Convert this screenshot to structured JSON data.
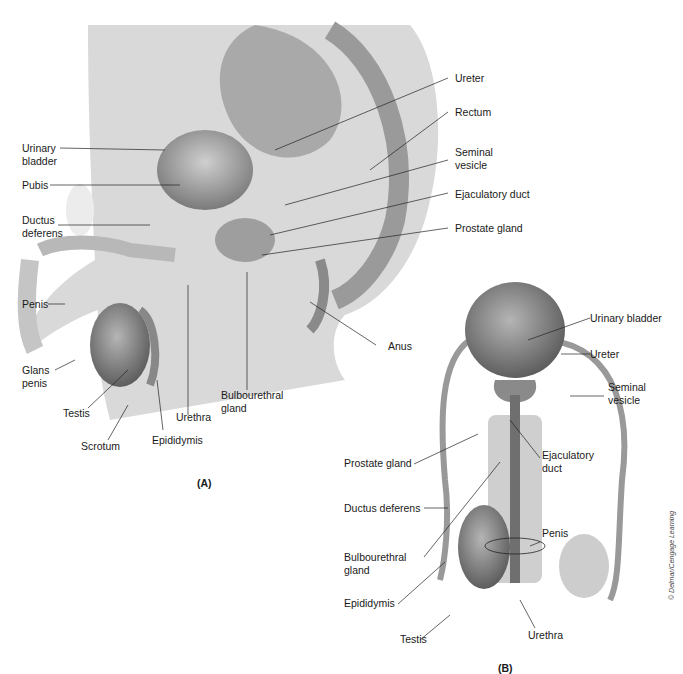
{
  "figure": {
    "panel_a": {
      "id_label": "(A)",
      "labels": {
        "urinary_bladder": "Urinary\nbladder",
        "pubis": "Pubis",
        "ductus_deferens": "Ductus\ndeferens",
        "penis": "Penis",
        "glans_penis": "Glans\npenis",
        "testis": "Testis",
        "scrotum": "Scrotum",
        "epididymis": "Epididymis",
        "urethra": "Urethra",
        "bulbourethral_gland": "Bulbourethral\ngland",
        "anus": "Anus",
        "ureter": "Ureter",
        "rectum": "Rectum",
        "seminal_vesicle": "Seminal\nvesicle",
        "ejaculatory_duct": "Ejaculatory duct",
        "prostate_gland": "Prostate gland"
      }
    },
    "panel_b": {
      "id_label": "(B)",
      "labels": {
        "urinary_bladder": "Urinary bladder",
        "ureter": "Ureter",
        "seminal_vesicle": "Seminal\nvesicle",
        "prostate_gland": "Prostate gland",
        "ejaculatory_duct": "Ejaculatory\nduct",
        "ductus_deferens": "Ductus deferens",
        "penis": "Penis",
        "bulbourethral_gland": "Bulbourethral\ngland",
        "epididymis": "Epididymis",
        "testis": "Testis",
        "urethra": "Urethra"
      }
    },
    "credit": "© Delmar/Cengage Learning"
  }
}
